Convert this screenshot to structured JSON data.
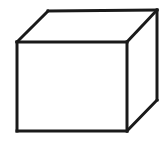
{
  "figure": {
    "name": "cube-line-drawing",
    "title": "Cube",
    "background_color": "#ffffff",
    "stroke_color": "#1a1a1a",
    "face_fill_color": "#ffffff",
    "stroke_width": 3,
    "canvas": {
      "width": 165,
      "height": 141
    },
    "vertices": {
      "front_top_left": {
        "x": 17,
        "y": 42
      },
      "front_top_right": {
        "x": 127,
        "y": 42
      },
      "front_bottom_right": {
        "x": 127,
        "y": 131
      },
      "front_bottom_left": {
        "x": 17,
        "y": 131
      },
      "back_top_left": {
        "x": 48,
        "y": 11
      },
      "back_top_right": {
        "x": 157,
        "y": 10
      },
      "back_bottom_right": {
        "x": 157,
        "y": 100
      }
    },
    "faces": [
      {
        "name": "front-face",
        "points": "17,42 127,42 127,131 17,131"
      },
      {
        "name": "top-face",
        "points": "17,42 48,11 157,10 127,42"
      },
      {
        "name": "right-face",
        "points": "127,42 157,10 157,100 127,131"
      }
    ],
    "edges": [
      {
        "name": "edge-front-top",
        "x1": 17,
        "y1": 42,
        "x2": 127,
        "y2": 42
      },
      {
        "name": "edge-front-right",
        "x1": 127,
        "y1": 42,
        "x2": 127,
        "y2": 131
      },
      {
        "name": "edge-front-bottom",
        "x1": 127,
        "y1": 131,
        "x2": 17,
        "y2": 131
      },
      {
        "name": "edge-front-left",
        "x1": 17,
        "y1": 131,
        "x2": 17,
        "y2": 42
      },
      {
        "name": "edge-top-left-diagonal",
        "x1": 17,
        "y1": 42,
        "x2": 48,
        "y2": 11
      },
      {
        "name": "edge-back-top",
        "x1": 48,
        "y1": 11,
        "x2": 157,
        "y2": 10
      },
      {
        "name": "edge-top-right-diagonal",
        "x1": 157,
        "y1": 10,
        "x2": 127,
        "y2": 42
      },
      {
        "name": "edge-back-right",
        "x1": 157,
        "y1": 10,
        "x2": 157,
        "y2": 100
      },
      {
        "name": "edge-bottom-right-diagonal",
        "x1": 157,
        "y1": 100,
        "x2": 127,
        "y2": 131
      }
    ]
  }
}
